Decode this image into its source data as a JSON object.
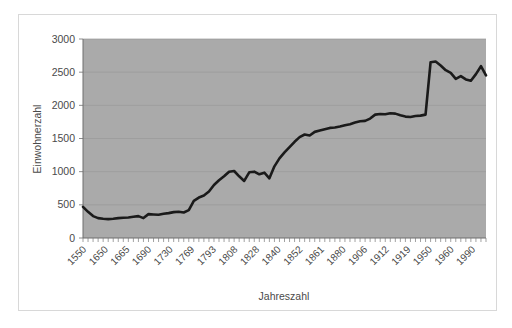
{
  "figure": {
    "background_color": "#ffffff",
    "border_color": "#d8d8d8",
    "plot_background_color": "#aaaaaa",
    "line_color": "#1a1a1a",
    "text_color": "#4a4a4a"
  },
  "chart_data": {
    "type": "line",
    "title": "",
    "xlabel": "Jahreszahl",
    "ylabel": "Einwohnerzahl",
    "ylim": [
      0,
      3000
    ],
    "yticks": [
      0,
      500,
      1000,
      1500,
      2000,
      2500,
      3000
    ],
    "ytick_labels": [
      "0",
      "500",
      "1000",
      "1500",
      "2000",
      "2500",
      "3000"
    ],
    "grid": true,
    "legend": false,
    "legend_position": "none",
    "xtick_labels": [
      "1550",
      "1650",
      "1665",
      "1690",
      "1730",
      "1769",
      "1793",
      "1808",
      "1828",
      "1840",
      "1852",
      "1861",
      "1880",
      "1906",
      "1912",
      "1919",
      "1950",
      "1960",
      "1990"
    ],
    "xtick_label_rotation": 45,
    "categories": [
      "1550",
      "1560",
      "1570",
      "1580",
      "1590",
      "1600",
      "1610",
      "1620",
      "1630",
      "1640",
      "1650",
      "1655",
      "1660",
      "1665",
      "1670",
      "1675",
      "1680",
      "1685",
      "1690",
      "1700",
      "1710",
      "1720",
      "1730",
      "1740",
      "1750",
      "1760",
      "1769",
      "1775",
      "1780",
      "1785",
      "1790",
      "1793",
      "1796",
      "1799",
      "1802",
      "1805",
      "1808",
      "1812",
      "1816",
      "1820",
      "1824",
      "1828",
      "1832",
      "1836",
      "1840",
      "1844",
      "1848",
      "1852",
      "1855",
      "1858",
      "1861",
      "1867",
      "1871",
      "1875",
      "1880",
      "1885",
      "1890",
      "1895",
      "1900",
      "1906",
      "1909",
      "1912",
      "1915",
      "1919",
      "1925",
      "1933",
      "1939",
      "1946",
      "1950",
      "1953",
      "1956",
      "1960",
      "1965",
      "1970",
      "1975",
      "1980",
      "1985",
      "1990",
      "1995",
      "2000",
      "2005"
    ],
    "values": [
      470,
      395,
      330,
      300,
      290,
      285,
      290,
      300,
      305,
      310,
      320,
      330,
      300,
      360,
      355,
      350,
      365,
      375,
      390,
      395,
      385,
      420,
      560,
      610,
      640,
      700,
      800,
      870,
      930,
      1000,
      1010,
      930,
      860,
      990,
      1000,
      960,
      985,
      900,
      1080,
      1200,
      1290,
      1370,
      1450,
      1520,
      1560,
      1545,
      1600,
      1620,
      1640,
      1660,
      1665,
      1680,
      1700,
      1715,
      1740,
      1760,
      1765,
      1800,
      1860,
      1870,
      1865,
      1880,
      1875,
      1850,
      1830,
      1825,
      1840,
      1845,
      1860,
      2650,
      2660,
      2600,
      2530,
      2490,
      2400,
      2440,
      2390,
      2370,
      2470,
      2590,
      2450
    ],
    "series": [
      {
        "name": "Einwohnerzahl",
        "values": [
          470,
          395,
          330,
          300,
          290,
          285,
          290,
          300,
          305,
          310,
          320,
          330,
          300,
          360,
          355,
          350,
          365,
          375,
          390,
          395,
          385,
          420,
          560,
          610,
          640,
          700,
          800,
          870,
          930,
          1000,
          1010,
          930,
          860,
          990,
          1000,
          960,
          985,
          900,
          1080,
          1200,
          1290,
          1370,
          1450,
          1520,
          1560,
          1545,
          1600,
          1620,
          1640,
          1660,
          1665,
          1680,
          1700,
          1715,
          1740,
          1760,
          1765,
          1800,
          1860,
          1870,
          1865,
          1880,
          1875,
          1850,
          1830,
          1825,
          1840,
          1845,
          1860,
          2650,
          2660,
          2600,
          2530,
          2490,
          2400,
          2440,
          2390,
          2370,
          2470,
          2590,
          2450
        ]
      }
    ]
  }
}
